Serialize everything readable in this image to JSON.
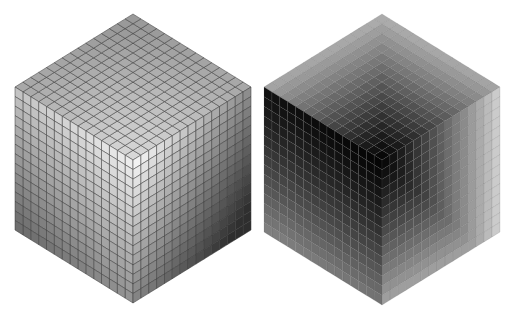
{
  "figure": {
    "grid_divisions": 15,
    "cubes": [
      {
        "name": "light-shaded-cube",
        "shading": "illumination",
        "faces": {
          "top": {
            "near_center": "#d8d8d8",
            "far": "#9a9a9a"
          },
          "left": {
            "near_center": "#ececec",
            "far": "#6e6e6e"
          },
          "right": {
            "near_center": "#f2f2f2",
            "far": "#2e2e2e"
          }
        },
        "grid_line_color": "#3a3a3a"
      },
      {
        "name": "dark-shaded-cube",
        "shading": "distance",
        "faces": {
          "top": {
            "near_center": "#080808",
            "far": "#b8b8b8"
          },
          "left": {
            "near_center": "#050505",
            "far": "#8a8a8a"
          },
          "right": {
            "near_center": "#0a0a0a",
            "far": "#dcdcdc"
          }
        },
        "grid_line_color": "#5a5a5a"
      }
    ]
  },
  "caption": {
    "text": ""
  }
}
